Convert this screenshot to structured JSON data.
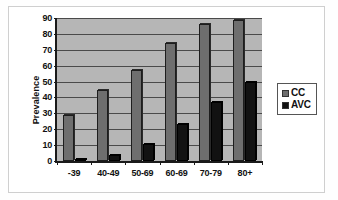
{
  "chart_data": {
    "type": "bar",
    "title": "",
    "xlabel": "",
    "ylabel": "Prevalence",
    "ylim": [
      0,
      90
    ],
    "ytick_step": 10,
    "yticks": [
      0,
      10,
      20,
      30,
      40,
      50,
      60,
      70,
      80,
      90
    ],
    "grid": true,
    "legend_position": "right",
    "categories": [
      "-39",
      "40-49",
      "50-69",
      "60-69",
      "70-79",
      "80+"
    ],
    "series": [
      {
        "name": "CC",
        "color": "#6e6e6e",
        "values": [
          29,
          45,
          57,
          74,
          86,
          89
        ]
      },
      {
        "name": "AVC",
        "color": "#121212",
        "values": [
          1,
          4,
          11,
          23,
          37,
          50
        ]
      }
    ]
  },
  "legend": {
    "items": [
      {
        "label": "CC",
        "swatch": "gray-square-icon"
      },
      {
        "label": "AVC",
        "swatch": "black-square-icon"
      }
    ]
  }
}
